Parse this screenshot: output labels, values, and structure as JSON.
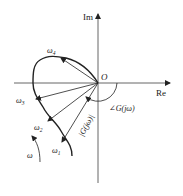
{
  "diagram": {
    "type": "polar-plot (Nyquist) of frequency response",
    "axes": {
      "imag_label": "Im",
      "real_label": "Re",
      "origin_label": "O"
    },
    "curve_points": [
      {
        "label": "ω",
        "sub": "1"
      },
      {
        "label": "ω",
        "sub": "2"
      },
      {
        "label": "ω",
        "sub": "3"
      },
      {
        "label": "ω",
        "sub": "4"
      }
    ],
    "magnitude_label": "|G(jω)|",
    "phase_label": "∠G(jω)",
    "direction_label": "ω",
    "colors": {
      "line": "#222222",
      "axis": "#444444",
      "background": "#ffffff"
    }
  }
}
